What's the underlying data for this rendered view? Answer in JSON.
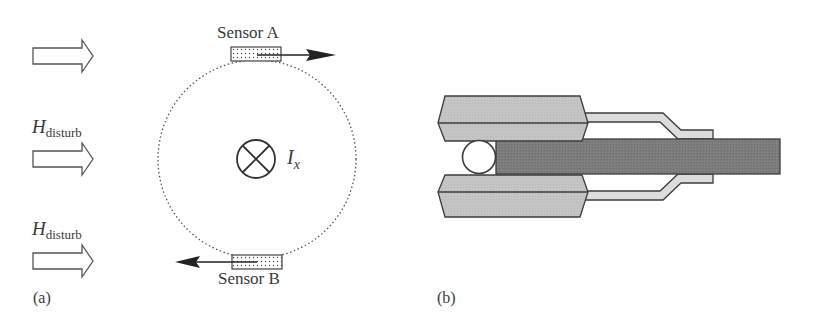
{
  "panel_a": {
    "label": "(a)",
    "field_labels": [
      {
        "symbol": "H",
        "subscript": "disturb"
      },
      {
        "symbol": "H",
        "subscript": "disturb"
      }
    ],
    "field_arrow_count": 3,
    "sensor_top": "Sensor A",
    "sensor_bottom": "Sensor B",
    "current": {
      "symbol": "I",
      "subscript": "x",
      "direction": "into-page"
    }
  },
  "panel_b": {
    "label": "(b)",
    "description": "clamp-style sensor housing with conductor bar and round wire",
    "colors": {
      "jaw": "#c2c2c2",
      "bar": "#7a7a7a",
      "sleeve": "#dcdcdc",
      "outline": "#3c3c3c"
    }
  }
}
